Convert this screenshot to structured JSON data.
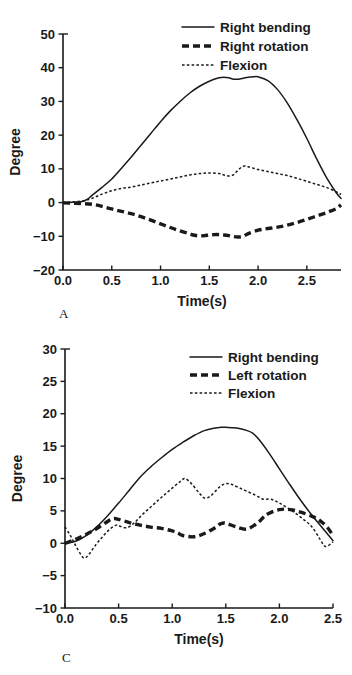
{
  "figure": {
    "background": "#ffffff",
    "ink": "#1a1a1a"
  },
  "panels": [
    {
      "letter": "A",
      "xlabel": "Time(s)",
      "ylabel": "Degree"
    },
    {
      "letter": "C",
      "xlabel": "Time(s)",
      "ylabel": "Degree"
    }
  ],
  "chart_data": [
    {
      "type": "line",
      "panel": "A",
      "title": "",
      "xlabel": "Time(s)",
      "ylabel": "Degree",
      "xlim": [
        0.0,
        2.85
      ],
      "ylim": [
        -20,
        50
      ],
      "xticks": [
        0.0,
        0.5,
        1.0,
        1.5,
        2.0,
        2.5
      ],
      "xtick_labels": [
        "0.0",
        "0.5",
        "1.0",
        "1.5",
        "2.0",
        "2.5"
      ],
      "yticks": [
        -20,
        -10,
        0,
        10,
        20,
        30,
        40,
        50
      ],
      "ytick_labels": [
        "−20",
        "−10",
        "0",
        "10",
        "20",
        "30",
        "40",
        "50"
      ],
      "grid": false,
      "legend_position": "top-right",
      "series": [
        {
          "name": "Right bending",
          "style": "solid",
          "x": [
            0.0,
            0.1,
            0.2,
            0.25,
            0.3,
            0.4,
            0.5,
            0.6,
            0.7,
            0.8,
            0.9,
            1.0,
            1.1,
            1.2,
            1.3,
            1.4,
            1.5,
            1.6,
            1.65,
            1.7,
            1.75,
            1.8,
            1.85,
            1.9,
            1.95,
            2.0,
            2.1,
            2.2,
            2.3,
            2.4,
            2.5,
            2.6,
            2.7,
            2.8,
            2.85
          ],
          "y": [
            0.0,
            0.1,
            0.3,
            1.0,
            2.2,
            4.5,
            7.0,
            10.2,
            13.5,
            17.0,
            20.5,
            24.0,
            27.2,
            30.0,
            32.5,
            34.5,
            36.0,
            37.0,
            37.2,
            37.0,
            36.6,
            36.6,
            36.9,
            37.2,
            37.3,
            37.3,
            36.2,
            33.5,
            29.5,
            24.5,
            19.0,
            13.0,
            7.5,
            3.0,
            1.2
          ]
        },
        {
          "name": "Right rotation",
          "style": "dashed",
          "x": [
            0.0,
            0.1,
            0.2,
            0.3,
            0.4,
            0.5,
            0.6,
            0.7,
            0.8,
            0.9,
            1.0,
            1.1,
            1.2,
            1.3,
            1.35,
            1.4,
            1.45,
            1.5,
            1.55,
            1.6,
            1.65,
            1.7,
            1.75,
            1.8,
            1.85,
            1.9,
            2.0,
            2.1,
            2.2,
            2.3,
            2.4,
            2.5,
            2.6,
            2.7,
            2.8,
            2.85
          ],
          "y": [
            -0.1,
            -0.2,
            -0.3,
            -0.5,
            -1.1,
            -1.9,
            -2.6,
            -3.3,
            -4.2,
            -5.2,
            -6.3,
            -7.4,
            -8.4,
            -9.3,
            -9.7,
            -9.9,
            -9.8,
            -9.6,
            -9.5,
            -9.5,
            -9.6,
            -9.8,
            -10.1,
            -10.2,
            -10.0,
            -9.2,
            -8.2,
            -7.7,
            -7.3,
            -6.7,
            -5.9,
            -5.0,
            -4.0,
            -3.0,
            -1.8,
            -0.7
          ]
        },
        {
          "name": "Flexion",
          "style": "dotted",
          "x": [
            0.0,
            0.1,
            0.2,
            0.3,
            0.4,
            0.5,
            0.6,
            0.7,
            0.8,
            0.9,
            1.0,
            1.1,
            1.2,
            1.3,
            1.4,
            1.5,
            1.6,
            1.65,
            1.7,
            1.75,
            1.8,
            1.85,
            1.9,
            2.0,
            2.1,
            2.2,
            2.3,
            2.4,
            2.5,
            2.6,
            2.7,
            2.8,
            2.85
          ],
          "y": [
            0.0,
            0.2,
            0.5,
            1.3,
            2.5,
            3.5,
            4.2,
            4.6,
            5.2,
            5.8,
            6.4,
            7.0,
            7.6,
            8.2,
            8.6,
            8.8,
            8.6,
            8.2,
            7.9,
            8.3,
            9.8,
            10.8,
            10.6,
            9.8,
            9.2,
            8.6,
            8.0,
            7.2,
            6.3,
            5.4,
            4.5,
            3.2,
            2.4
          ]
        }
      ]
    },
    {
      "type": "line",
      "panel": "C",
      "title": "",
      "xlabel": "Time(s)",
      "ylabel": "Degree",
      "xlim": [
        0.0,
        2.5
      ],
      "ylim": [
        -10,
        30
      ],
      "xticks": [
        0.0,
        0.5,
        1.0,
        1.5,
        2.0,
        2.5
      ],
      "xtick_labels": [
        "0.0",
        "0.5",
        "1.0",
        "1.5",
        "2.0",
        "2.5"
      ],
      "yticks": [
        -10,
        -5,
        0,
        5,
        10,
        15,
        20,
        25,
        30
      ],
      "ytick_labels": [
        "−10",
        "−5",
        "0",
        "5",
        "10",
        "15",
        "20",
        "25",
        "30"
      ],
      "grid": false,
      "legend_position": "top-right",
      "series": [
        {
          "name": "Right bending",
          "style": "solid",
          "x": [
            0.0,
            0.1,
            0.2,
            0.3,
            0.4,
            0.5,
            0.6,
            0.7,
            0.8,
            0.9,
            1.0,
            1.1,
            1.2,
            1.3,
            1.4,
            1.45,
            1.5,
            1.6,
            1.7,
            1.75,
            1.8,
            1.9,
            2.0,
            2.1,
            2.2,
            2.3,
            2.4,
            2.45,
            2.5
          ],
          "y": [
            0.0,
            0.3,
            1.2,
            2.6,
            4.3,
            6.2,
            8.2,
            10.2,
            11.8,
            13.2,
            14.5,
            15.6,
            16.6,
            17.4,
            17.8,
            17.9,
            17.9,
            17.8,
            17.4,
            17.0,
            16.2,
            14.0,
            11.5,
            9.0,
            6.6,
            4.4,
            2.4,
            1.4,
            0.4
          ]
        },
        {
          "name": "Left rotation",
          "style": "dashed",
          "x": [
            0.0,
            0.1,
            0.2,
            0.3,
            0.4,
            0.45,
            0.5,
            0.6,
            0.7,
            0.8,
            0.9,
            1.0,
            1.05,
            1.1,
            1.2,
            1.3,
            1.4,
            1.45,
            1.5,
            1.6,
            1.7,
            1.8,
            1.85,
            1.9,
            2.0,
            2.1,
            2.2,
            2.3,
            2.35,
            2.4,
            2.45,
            2.5
          ],
          "y": [
            0.0,
            0.6,
            1.4,
            2.3,
            3.4,
            3.8,
            3.7,
            3.2,
            2.8,
            2.5,
            2.3,
            1.9,
            1.6,
            1.2,
            1.0,
            1.5,
            2.4,
            3.0,
            3.1,
            2.5,
            2.2,
            3.2,
            4.0,
            4.6,
            5.2,
            5.2,
            4.8,
            4.2,
            3.8,
            3.2,
            2.4,
            1.2
          ]
        },
        {
          "name": "Flexion",
          "style": "dotted",
          "x": [
            0.0,
            0.05,
            0.1,
            0.15,
            0.18,
            0.22,
            0.28,
            0.35,
            0.42,
            0.48,
            0.52,
            0.58,
            0.65,
            0.72,
            0.8,
            0.88,
            0.95,
            1.02,
            1.08,
            1.12,
            1.18,
            1.25,
            1.3,
            1.35,
            1.4,
            1.45,
            1.5,
            1.55,
            1.62,
            1.7,
            1.78,
            1.85,
            1.92,
            2.0,
            2.1,
            2.2,
            2.3,
            2.38,
            2.43,
            2.5
          ],
          "y": [
            2.5,
            1.2,
            -0.4,
            -1.8,
            -2.3,
            -1.8,
            -0.4,
            1.0,
            2.2,
            2.8,
            2.6,
            2.4,
            3.2,
            4.4,
            5.6,
            6.8,
            7.8,
            8.8,
            9.6,
            10.0,
            9.2,
            7.8,
            7.0,
            7.2,
            8.0,
            8.8,
            9.2,
            9.1,
            8.6,
            8.0,
            7.4,
            6.8,
            6.8,
            6.2,
            5.2,
            4.0,
            2.6,
            0.6,
            -0.5,
            0.2
          ]
        }
      ]
    }
  ]
}
